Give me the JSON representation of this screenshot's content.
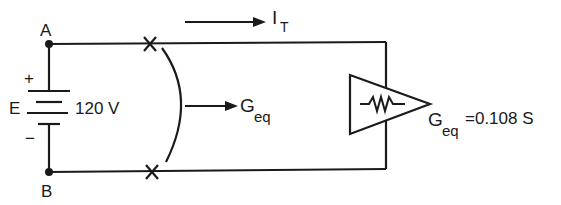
{
  "diagram": {
    "type": "circuit",
    "nodes": {
      "a": {
        "label": "A"
      },
      "b": {
        "label": "B"
      }
    },
    "source": {
      "label": "E",
      "voltage": "120 V",
      "plus": "+",
      "minus": "−"
    },
    "current": {
      "symbol": "I",
      "subscript": "T"
    },
    "equivalent_arrow": {
      "symbol": "G",
      "subscript": "eq"
    },
    "load": {
      "symbol": "G",
      "subscript": "eq",
      "value": "=0.108 S"
    },
    "colors": {
      "line": "#1a1a1a",
      "background": "#ffffff"
    }
  }
}
